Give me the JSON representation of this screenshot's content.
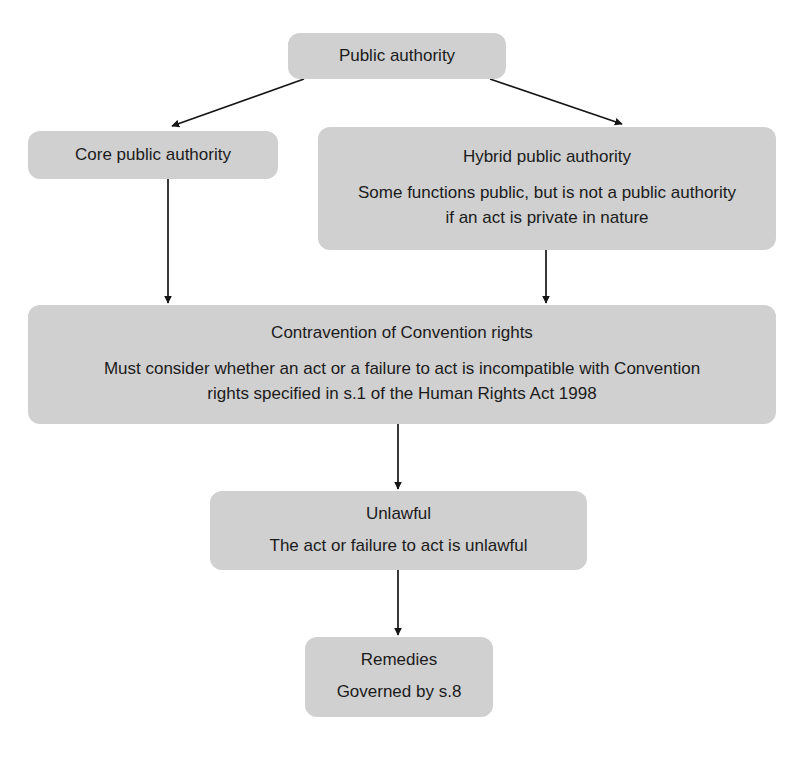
{
  "diagram": {
    "palette": {
      "node_fill": "#d0d0d0",
      "text": "#1b1b1b",
      "connector": "#151515",
      "background": "#ffffff"
    },
    "nodes": {
      "public_authority": {
        "title": "Public authority"
      },
      "core_public_authority": {
        "title": "Core public authority"
      },
      "hybrid_public_authority": {
        "title": "Hybrid public authority",
        "body": "Some functions public, but is not a public authority if an act is private in nature"
      },
      "contravention": {
        "title": "Contravention of Convention rights",
        "body": "Must consider whether an act or a failure to act is incompatible with Convention rights specified in s.1 of the Human Rights Act 1998"
      },
      "unlawful": {
        "title": "Unlawful",
        "body": "The act or failure to act is unlawful"
      },
      "remedies": {
        "title": "Remedies",
        "body": "Governed by s.8"
      }
    },
    "connectors": [
      {
        "name": "public-authority-to-core",
        "from": "public_authority",
        "to": "core_public_authority",
        "style": "diagonal-arrow"
      },
      {
        "name": "public-authority-to-hybrid",
        "from": "public_authority",
        "to": "hybrid_public_authority",
        "style": "diagonal-arrow"
      },
      {
        "name": "core-to-contravention",
        "from": "core_public_authority",
        "to": "contravention",
        "style": "vertical-arrow"
      },
      {
        "name": "hybrid-to-contravention",
        "from": "hybrid_public_authority",
        "to": "contravention",
        "style": "vertical-arrow"
      },
      {
        "name": "contravention-to-unlawful",
        "from": "contravention",
        "to": "unlawful",
        "style": "vertical-arrow"
      },
      {
        "name": "unlawful-to-remedies",
        "from": "unlawful",
        "to": "remedies",
        "style": "vertical-arrow"
      }
    ]
  }
}
